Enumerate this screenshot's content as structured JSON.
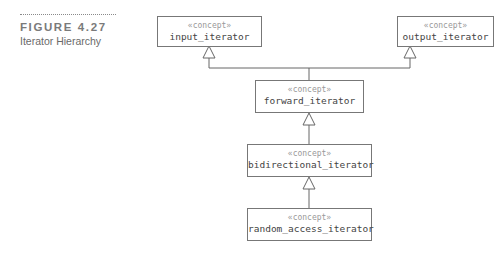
{
  "figure": {
    "number": "FIGURE 4.27",
    "title": "Iterator Hierarchy"
  },
  "diagram": {
    "nodes": [
      {
        "id": "input_iterator",
        "stereotype": "«concept»",
        "name": "input_iterator"
      },
      {
        "id": "output_iterator",
        "stereotype": "«concept»",
        "name": "output_iterator"
      },
      {
        "id": "forward_iterator",
        "stereotype": "«concept»",
        "name": "forward_iterator"
      },
      {
        "id": "bidirectional_iterator",
        "stereotype": "«concept»",
        "name": "bidirectional_iterator"
      },
      {
        "id": "random_access_iterator",
        "stereotype": "«concept»",
        "name": "random_access_iterator"
      }
    ],
    "edges": [
      {
        "from": "forward_iterator",
        "to": "input_iterator",
        "type": "generalization"
      },
      {
        "from": "forward_iterator",
        "to": "output_iterator",
        "type": "generalization"
      },
      {
        "from": "bidirectional_iterator",
        "to": "forward_iterator",
        "type": "generalization"
      },
      {
        "from": "random_access_iterator",
        "to": "bidirectional_iterator",
        "type": "generalization"
      }
    ]
  }
}
